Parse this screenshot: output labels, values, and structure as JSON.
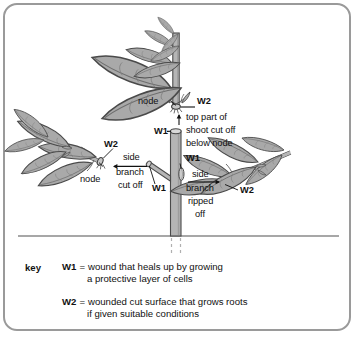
{
  "diagram": {
    "type": "botanical-illustration",
    "colors": {
      "frame": "#9a9a9a",
      "leaf_fill": "#a9a9a9",
      "leaf_outline": "#4a4a4a",
      "stem_fill": "#b5b5b5",
      "stem_outline": "#4a4a4a",
      "ground_line": "#8a8a8a",
      "text": "#111111"
    },
    "annotations": [
      {
        "id": "node-top",
        "text": "node"
      },
      {
        "id": "w2-top",
        "text": "W2"
      },
      {
        "id": "w1-top",
        "text": "W1"
      },
      {
        "id": "top-part-1",
        "text": "top part of"
      },
      {
        "id": "top-part-2",
        "text": "shoot cut off"
      },
      {
        "id": "top-part-3",
        "text": "below node"
      },
      {
        "id": "w2-left",
        "text": "W2"
      },
      {
        "id": "node-left",
        "text": "node"
      },
      {
        "id": "side-left-1",
        "text": "side"
      },
      {
        "id": "side-left-2",
        "text": "branch"
      },
      {
        "id": "side-left-3",
        "text": "cut off"
      },
      {
        "id": "w1-left",
        "text": "W1"
      },
      {
        "id": "w1-right",
        "text": "W1"
      },
      {
        "id": "side-right-1",
        "text": "side"
      },
      {
        "id": "side-right-2",
        "text": "branch"
      },
      {
        "id": "side-right-3",
        "text": "ripped"
      },
      {
        "id": "side-right-4",
        "text": "off"
      },
      {
        "id": "w2-right",
        "text": "W2"
      }
    ],
    "labels": {
      "node_top": "node",
      "w2_top": "W2",
      "w1_top": "W1",
      "top_part_line1": "top part of",
      "top_part_line2": "shoot cut off",
      "top_part_line3": "below node",
      "w2_left": "W2",
      "node_left": "node",
      "side_left_line1": "side",
      "side_left_line2": "branch",
      "side_left_line3": "cut off",
      "w1_left": "W1",
      "w1_right": "W1",
      "side_right_line1": "side",
      "side_right_line2": "branch",
      "side_right_line3": "ripped",
      "side_right_line4": "off",
      "w2_right": "W2"
    }
  },
  "key": {
    "heading": "key",
    "entries": [
      {
        "symbol": "W1",
        "equals": "=",
        "line1": "wound that heals up by growing",
        "line2": "a protective layer of cells"
      },
      {
        "symbol": "W2",
        "equals": "=",
        "line1": "wounded cut surface that grows roots",
        "line2": "if given suitable conditions"
      }
    ]
  }
}
